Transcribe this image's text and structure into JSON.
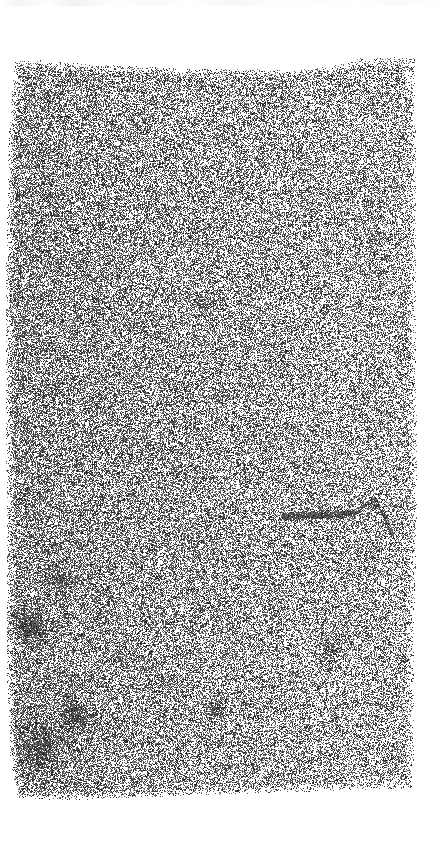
{
  "canvas": {
    "width": 448,
    "height": 854,
    "background_color": "#ffffff",
    "ink_color": "#1a1a1a"
  },
  "document_scan": {
    "label": "degraded noise scan",
    "caption_text": "",
    "field": {
      "left": 5,
      "right": 415,
      "top": 58,
      "bottom": 800,
      "mean_coverage": 0.46,
      "grain_pixel_size": 1,
      "seed": 20240517
    },
    "top_edge_profile": [
      {
        "x": 0,
        "y": 62
      },
      {
        "x": 40,
        "y": 60
      },
      {
        "x": 90,
        "y": 64
      },
      {
        "x": 140,
        "y": 66
      },
      {
        "x": 190,
        "y": 69
      },
      {
        "x": 240,
        "y": 68
      },
      {
        "x": 290,
        "y": 70
      },
      {
        "x": 330,
        "y": 66
      },
      {
        "x": 360,
        "y": 58
      },
      {
        "x": 400,
        "y": 56
      },
      {
        "x": 448,
        "y": 57
      }
    ],
    "bottom_edge_profile": [
      {
        "x": 0,
        "y": 796
      },
      {
        "x": 60,
        "y": 800
      },
      {
        "x": 120,
        "y": 798
      },
      {
        "x": 190,
        "y": 795
      },
      {
        "x": 250,
        "y": 793
      },
      {
        "x": 310,
        "y": 791
      },
      {
        "x": 370,
        "y": 789
      },
      {
        "x": 415,
        "y": 788
      },
      {
        "x": 448,
        "y": 788
      }
    ],
    "left_edge_profile": [
      {
        "y": 58,
        "x": 14
      },
      {
        "y": 140,
        "x": 8
      },
      {
        "y": 260,
        "x": 6
      },
      {
        "y": 400,
        "x": 5
      },
      {
        "y": 540,
        "x": 7
      },
      {
        "y": 660,
        "x": 6
      },
      {
        "y": 760,
        "x": 10
      },
      {
        "y": 800,
        "x": 18
      }
    ],
    "right_edge_profile": [
      {
        "y": 58,
        "x": 414
      },
      {
        "y": 180,
        "x": 416
      },
      {
        "y": 320,
        "x": 415
      },
      {
        "y": 470,
        "x": 417
      },
      {
        "y": 620,
        "x": 414
      },
      {
        "y": 760,
        "x": 413
      },
      {
        "y": 800,
        "x": 412
      }
    ],
    "density_gradient": {
      "left_boost": 0.1,
      "right_falloff": 0.05,
      "vertical_drift": 0.03
    },
    "dark_blobs": [
      {
        "name": "blob-upper-left",
        "x": 30,
        "y": 625,
        "radius": 13,
        "strength": 0.42
      },
      {
        "name": "blob-lower-left",
        "x": 75,
        "y": 715,
        "radius": 11,
        "strength": 0.46
      },
      {
        "name": "blob-bottom-left",
        "x": 40,
        "y": 745,
        "radius": 20,
        "strength": 0.34
      },
      {
        "name": "blob-mid-left",
        "x": 58,
        "y": 580,
        "radius": 10,
        "strength": 0.3
      },
      {
        "name": "blob-center-low",
        "x": 215,
        "y": 710,
        "radius": 8,
        "strength": 0.38
      },
      {
        "name": "blob-right-mid",
        "x": 330,
        "y": 650,
        "radius": 9,
        "strength": 0.3
      },
      {
        "name": "blob-upper-center",
        "x": 205,
        "y": 305,
        "radius": 9,
        "strength": 0.22
      },
      {
        "name": "blob-right-upper",
        "x": 372,
        "y": 240,
        "radius": 8,
        "strength": 0.22
      }
    ],
    "dark_streaks": [
      {
        "name": "streak-mid-right",
        "x1": 285,
        "y1": 516,
        "x2": 352,
        "y2": 513,
        "thickness": 2,
        "strength": 0.72
      },
      {
        "name": "streak-right-upper",
        "x1": 378,
        "y1": 505,
        "x2": 392,
        "y2": 534,
        "thickness": 1,
        "strength": 0.5
      },
      {
        "name": "streak-top-right",
        "x1": 356,
        "y1": 512,
        "x2": 372,
        "y2": 500,
        "thickness": 1,
        "strength": 0.4
      }
    ],
    "bottom_wisp": {
      "name": "bottom-wisp",
      "left": 40,
      "right": 150,
      "top": 783,
      "bottom": 797,
      "coverage": 0.12
    }
  }
}
